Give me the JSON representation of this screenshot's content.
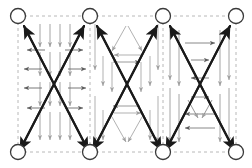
{
  "figure": {
    "canvas": {
      "width": 252,
      "height": 168,
      "background": "#ffffff"
    },
    "colors": {
      "node_stroke": "#3a3a3a",
      "node_fill": "#ffffff",
      "dashed_grid": "#b8b8b8",
      "bold_arrow": "#1a1a1a",
      "thin_arrow_dark": "#6a6a6a",
      "thin_arrow_light": "#a8a8a8"
    },
    "legend_note": "",
    "nodes": {
      "label": "graph-node",
      "radius": 7.5,
      "top_row_y": 16,
      "bottom_row_y": 152,
      "columns_x": [
        18,
        90,
        163,
        236
      ],
      "count": 8
    },
    "dashed_frame": {
      "x": 18,
      "y": 16,
      "width": 218,
      "height": 136,
      "vertical_lines_x": [
        18,
        90,
        163,
        236
      ],
      "dash_pattern": "3,3"
    },
    "cells": [
      {
        "name": "cell-left",
        "pattern": "vertical-and-horizontal-arrow-grid",
        "x_left": 18,
        "x_right": 90,
        "vertical_arrow_count": 4,
        "horizontal_arrow_rows": 4
      },
      {
        "name": "cell-middle",
        "pattern": "triangle-diamond-arrows",
        "x_left": 90,
        "x_right": 163,
        "triangle_count": 2,
        "diamond_count": 1
      },
      {
        "name": "cell-right",
        "pattern": "nested-horizontal-and-vertical-arrows",
        "x_left": 163,
        "x_right": 236,
        "horizontal_arrow_rows": 4,
        "vertical_arrow_count": 4
      }
    ],
    "bold_diagonals": [
      {
        "name": "x-cross-1",
        "from": [
          90,
          152
        ],
        "to": [
          22,
          24
        ]
      },
      {
        "name": "x-cross-2",
        "from": [
          18,
          152
        ],
        "to": [
          86,
          24
        ]
      },
      {
        "name": "x-cross-3",
        "from": [
          163,
          152
        ],
        "to": [
          95,
          24
        ]
      },
      {
        "name": "x-cross-4",
        "from": [
          90,
          152
        ],
        "to": [
          159,
          24
        ]
      },
      {
        "name": "x-cross-5",
        "from": [
          236,
          152
        ],
        "to": [
          168,
          24
        ]
      },
      {
        "name": "x-cross-6",
        "from": [
          163,
          152
        ],
        "to": [
          232,
          24
        ]
      }
    ]
  }
}
